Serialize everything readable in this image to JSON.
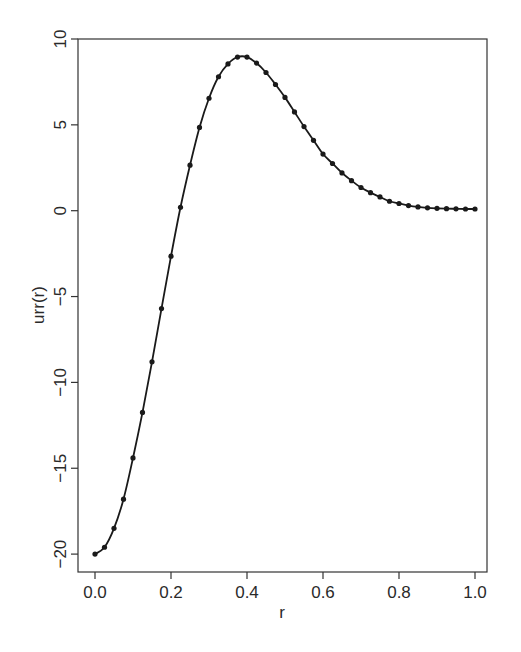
{
  "chart_data": {
    "type": "line",
    "title": "",
    "xlabel": "r",
    "ylabel": "urr(r)",
    "xlim": [
      0,
      1
    ],
    "ylim": [
      -20,
      10
    ],
    "grid": false,
    "legend": null,
    "x_ticks": [
      "0.0",
      "0.2",
      "0.4",
      "0.6",
      "0.8",
      "1.0"
    ],
    "y_ticks": [
      "-20",
      "-15",
      "-10",
      "-5",
      "0",
      "5",
      "10"
    ],
    "markers": true,
    "line_color": "#1a1a1a",
    "series": [
      {
        "name": "urr(r)",
        "x": [
          0,
          0.025,
          0.05,
          0.075,
          0.1,
          0.125,
          0.15,
          0.175,
          0.2,
          0.225,
          0.25,
          0.275,
          0.3,
          0.325,
          0.35,
          0.375,
          0.4,
          0.425,
          0.45,
          0.475,
          0.5,
          0.525,
          0.55,
          0.575,
          0.6,
          0.625,
          0.65,
          0.675,
          0.7,
          0.725,
          0.75,
          0.775,
          0.8,
          0.825,
          0.85,
          0.875,
          0.9,
          0.925,
          0.95,
          0.975,
          1.0
        ],
        "values": [
          -20,
          -19.6,
          -18.5,
          -16.8,
          -14.4,
          -11.75,
          -8.8,
          -5.7,
          -2.65,
          0.2,
          2.65,
          4.85,
          6.55,
          7.8,
          8.55,
          8.95,
          8.95,
          8.6,
          8.05,
          7.35,
          6.6,
          5.75,
          4.9,
          4.1,
          3.3,
          2.75,
          2.2,
          1.75,
          1.35,
          1.05,
          0.8,
          0.55,
          0.42,
          0.3,
          0.22,
          0.17,
          0.14,
          0.12,
          0.11,
          0.1,
          0.1
        ]
      }
    ]
  }
}
